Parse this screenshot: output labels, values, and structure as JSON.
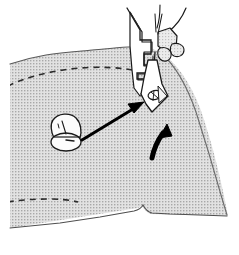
{
  "figure": {
    "caption": "Fabric positioned under the presser foot with stitching guide line and movement arrows",
    "background_color": "#ffffff",
    "line_color": "#1a1a1a",
    "fabric_fill": "#d9d9d9",
    "fabric_halftone_dot": "#9a9a9a",
    "machine_fill": "#ffffff",
    "arrow_color": "#000000",
    "dashed_color": "#222222"
  },
  "elements": [
    {
      "name": "fabric-panel",
      "label": "Fabric panel",
      "fill": "#d9d9d9",
      "outline": "#4a4a4a"
    },
    {
      "name": "stitch-guide-upper",
      "label": "Upper dashed stitching guide",
      "style": "dashed",
      "color": "#222222"
    },
    {
      "name": "stitch-guide-lower",
      "label": "Lower dashed stitching guide",
      "style": "dashed",
      "color": "#222222"
    },
    {
      "name": "presser-foot",
      "label": "Presser foot",
      "fill": "#ffffff",
      "outline": "#1a1a1a"
    },
    {
      "name": "needle-bar",
      "label": "Needle and needle bar",
      "outline": "#1a1a1a"
    },
    {
      "name": "machine-bed-left",
      "label": "Machine bed left housing",
      "fill": "#ffffff",
      "outline": "#1a1a1a"
    },
    {
      "name": "machine-arm-right",
      "label": "Machine arm right housing",
      "fill": "#ffffff",
      "outline": "#1a1a1a"
    },
    {
      "name": "marker-knob",
      "label": "Rounded marker knob on fabric",
      "fill": "#ffffff",
      "outline": "#1a1a1a"
    },
    {
      "name": "pointer-arrow",
      "label": "Straight pointer arrow from marker to needle",
      "direction": "up-right",
      "color": "#000000"
    },
    {
      "name": "motion-arrow",
      "label": "Curved motion arrow indicating feed direction",
      "direction": "up-left",
      "color": "#000000"
    }
  ],
  "annotations": {
    "pointer_arrow_from": "marker-knob",
    "pointer_arrow_to": "presser-foot",
    "motion_arrow_meaning": "fabric feed direction"
  }
}
